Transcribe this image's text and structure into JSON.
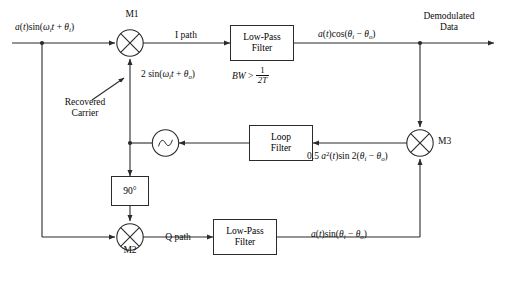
{
  "diagram": {
    "stroke_color": "#2b2b2b",
    "text_color": "#0c0c0c",
    "background": "#ffffff"
  },
  "signals": {
    "input": "a(t) sin(ωᵢt + θᵢ)",
    "i_path": "I path",
    "q_path": "Q path",
    "carrier": "2 sin(ωᵢt + θₒ)",
    "i_output": "a(t) cos(θᵢ − θₒ)",
    "q_output": "a(t) sin(θᵢ − θₒ)",
    "m3_output": "0.5 a²(t) sin 2(θᵢ − θₒ)",
    "demodulated_line1": "Demodulated",
    "demodulated_line2": "Data",
    "recovered_line1": "Recovered",
    "recovered_line2": "Carrier"
  },
  "blocks": {
    "lpf_top": {
      "line1": "Low-Pass",
      "line2": "Filter"
    },
    "lpf_bottom": {
      "line1": "Low-Pass",
      "line2": "Filter"
    },
    "loop_filter": {
      "line1": "Loop",
      "line2": "Filter"
    },
    "phase_shift": {
      "label": "90°"
    },
    "bw_note": {
      "prefix": "BW >",
      "numerator": "1",
      "denominator": "2T"
    }
  },
  "mixers": {
    "m1": "M1",
    "m2": "M2",
    "m3": "M3"
  },
  "vco": {
    "name": "vco-oscillator"
  }
}
